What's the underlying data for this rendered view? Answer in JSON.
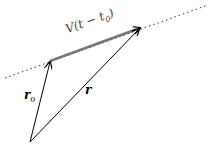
{
  "diagram": {
    "type": "vector-diagram",
    "labels": {
      "velocity_term": "V(t − t",
      "velocity_sub": "0",
      "velocity_close": ")",
      "r0_main": "r",
      "r0_sub": "0",
      "r": "r"
    },
    "points": {
      "origin": [
        30,
        142
      ],
      "r0_tip": [
        50,
        61
      ],
      "r_tip": [
        140,
        28
      ],
      "line_start": [
        5,
        78
      ],
      "line_end": [
        208,
        5
      ]
    },
    "colors": {
      "vector": "#000000",
      "velocity_segment": "#777777",
      "dotted_line": "#333333",
      "background": "#ffffff"
    }
  }
}
